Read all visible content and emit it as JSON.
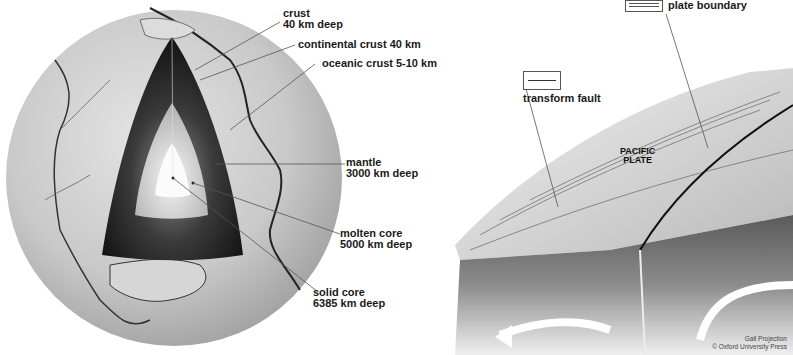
{
  "earth_cutaway": {
    "labels": [
      {
        "id": "crust",
        "line1": "crust",
        "line2": "40 km deep"
      },
      {
        "id": "continental-crust",
        "line1": "continental crust 40 km",
        "line2": ""
      },
      {
        "id": "oceanic-crust",
        "line1": "oceanic crust 5-10 km",
        "line2": ""
      },
      {
        "id": "mantle",
        "line1": "mantle",
        "line2": "3000 km deep"
      },
      {
        "id": "molten-core",
        "line1": "molten core",
        "line2": "5000 km deep"
      },
      {
        "id": "solid-core",
        "line1": "solid core",
        "line2": "6385 km deep"
      }
    ]
  },
  "plate_diagram": {
    "key_plate_boundary": "plate boundary",
    "key_transform_fault": "transform fault",
    "plate_name_line1": "PACIFIC",
    "plate_name_line2": "PLATE"
  },
  "credits": {
    "projection": "Gall Projection",
    "publisher": "© Oxford University Press"
  }
}
